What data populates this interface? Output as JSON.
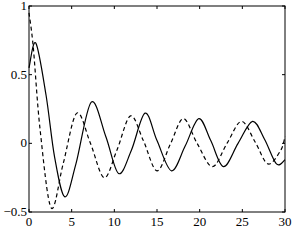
{
  "chart_data": {
    "type": "line",
    "title": "",
    "xlabel": "",
    "ylabel": "",
    "xlim": [
      0,
      30
    ],
    "ylim": [
      -0.5,
      1
    ],
    "xticks": [
      0,
      5,
      10,
      15,
      20,
      25,
      30
    ],
    "yticks": [
      -0.5,
      0,
      0.5,
      1
    ],
    "xtick_labels": [
      "0",
      "5",
      "10",
      "15",
      "20",
      "25",
      "30"
    ],
    "ytick_labels": [
      "−0.5",
      "0",
      "0.5",
      "1"
    ],
    "grid": false,
    "legend": null,
    "series": [
      {
        "name": "solid",
        "style": "solid",
        "color": "#000000",
        "x": [
          0,
          0.8,
          2,
          3,
          4.2,
          5.5,
          7.3,
          9,
          10.5,
          12,
          13.6,
          15,
          16.7,
          18.3,
          19.9,
          21.3,
          22.8,
          24.5,
          26.2,
          27.6,
          29,
          30
        ],
        "y": [
          0.55,
          0.73,
          0.35,
          -0.1,
          -0.39,
          -0.15,
          0.3,
          0.05,
          -0.22,
          -0.05,
          0.22,
          0.02,
          -0.2,
          -0.02,
          0.18,
          0.02,
          -0.17,
          0.0,
          0.16,
          0.03,
          -0.15,
          -0.12
        ]
      },
      {
        "name": "dashed",
        "style": "dashed",
        "color": "#000000",
        "x": [
          0,
          0.5,
          1.3,
          2.6,
          4,
          5.6,
          7.2,
          8.8,
          10.3,
          11.9,
          13.4,
          15,
          16.6,
          18.1,
          19.7,
          21.5,
          23.2,
          24.9,
          26.5,
          28,
          29.5,
          30
        ],
        "y": [
          0.95,
          0.7,
          0.1,
          -0.47,
          -0.15,
          0.22,
          0.0,
          -0.25,
          -0.05,
          0.2,
          0.02,
          -0.2,
          0.0,
          0.18,
          0.0,
          -0.17,
          0.0,
          0.16,
          0.01,
          -0.15,
          -0.05,
          0.05
        ]
      }
    ]
  }
}
